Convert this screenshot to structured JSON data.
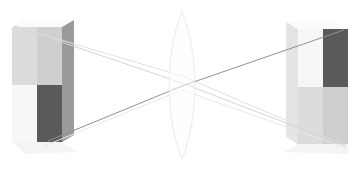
{
  "scene": {
    "title": "Convex lens ray diagram with inverted real image",
    "width": 360,
    "height": 171,
    "background_color": "#ffffff"
  },
  "lens": {
    "label": "biconvex-lens",
    "center_x": 182,
    "top_apex_y": 12,
    "bottom_apex_y": 159,
    "half_width": 17,
    "outline_color": "#e8ecef",
    "fill_color": "#fdfefe",
    "outline_width": 1
  },
  "object_box": {
    "label": "object-box",
    "front_left_x": 12,
    "front_right_x": 62,
    "front_top_y": 27,
    "front_bottom_y": 142,
    "depth_offset_x": 12,
    "depth_offset_y": 7,
    "split_x": 37,
    "split_y": 85,
    "quadrants": [
      {
        "name": "top-left",
        "color": "#dcdcdc"
      },
      {
        "name": "top-right",
        "color": "#cfcfcf"
      },
      {
        "name": "bottom-left",
        "color": "#f7f7f7"
      },
      {
        "name": "bottom-right",
        "color": "#5a5a5a"
      }
    ],
    "side_face_color": "#9a9a9a",
    "top_face_color": "#fbfbfb",
    "shadow_color": "#f4f4f4"
  },
  "image_box": {
    "label": "image-box-inverted",
    "front_left_x": 298,
    "front_right_x": 348,
    "front_top_y": 29,
    "front_bottom_y": 144,
    "depth_offset_x": 12,
    "depth_offset_y": 7,
    "split_x": 323,
    "split_y": 87,
    "quadrants": [
      {
        "name": "top-left",
        "color": "#f7f7f7"
      },
      {
        "name": "top-right",
        "color": "#5a5a5a"
      },
      {
        "name": "bottom-left",
        "color": "#dcdcdc"
      },
      {
        "name": "bottom-right",
        "color": "#cfcfcf"
      }
    ],
    "side_face_color": "#e4e4e4",
    "top_face_color": "#fbfbfb",
    "shadow_color": "#f4f4f4"
  },
  "rays": [
    {
      "name": "ray-upper-primary",
      "from_x": 14,
      "from_y": 26,
      "via_x": 182,
      "via_y": 83,
      "to_x": 346,
      "to_y": 146,
      "color": "#d2d6da",
      "width": 1
    },
    {
      "name": "ray-upper-secondary",
      "from_x": 14,
      "from_y": 26,
      "via_x": 182,
      "via_y": 76,
      "to_x": 346,
      "to_y": 146,
      "color": "#dde1e4",
      "width": 1
    },
    {
      "name": "ray-lower-primary",
      "from_x": 48,
      "from_y": 141,
      "via_x": 182,
      "via_y": 86,
      "to_x": 344,
      "to_y": 30,
      "color": "#8d9196",
      "width": 1
    },
    {
      "name": "ray-lower-secondary",
      "from_x": 44,
      "from_y": 146,
      "via_x": 182,
      "via_y": 90,
      "to_x": 346,
      "to_y": 148,
      "color": "#e6e9eb",
      "width": 1
    }
  ],
  "focal_point": {
    "name": "image-crossing-point",
    "x": 182,
    "y": 83
  }
}
